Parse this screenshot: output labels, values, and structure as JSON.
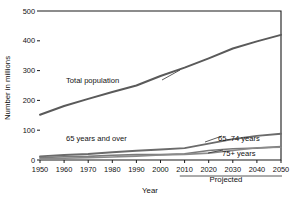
{
  "chart_data": {
    "type": "line",
    "title": "",
    "xlabel": "Year",
    "ylabel": "Number in millions",
    "x": [
      1950,
      1960,
      1970,
      1980,
      1990,
      2000,
      2010,
      2020,
      2030,
      2040,
      2050
    ],
    "xlim": [
      1950,
      2050
    ],
    "ylim": [
      0,
      500
    ],
    "yticks": [
      0,
      100,
      200,
      300,
      400,
      500
    ],
    "xticks": [
      "1950",
      "1960",
      "1970",
      "1980",
      "1990",
      "2000",
      "2010",
      "2020",
      "2030",
      "2040",
      "2050"
    ],
    "grid": false,
    "legend": "inline-annotations",
    "series": [
      {
        "name": "Total population",
        "color": "#5a5a5a",
        "values": [
          152,
          181,
          205,
          228,
          250,
          282,
          310,
          341,
          374,
          398,
          420
        ]
      },
      {
        "name": "65 years and over",
        "color": "#6b6b6b",
        "values": [
          12,
          17,
          20,
          26,
          31,
          35,
          40,
          55,
          70,
          81,
          88
        ]
      },
      {
        "name": "65–74 years",
        "color": "#7a7a7a",
        "values": [
          8,
          11,
          12,
          16,
          18,
          18,
          21,
          32,
          38,
          40,
          45
        ]
      },
      {
        "name": "75+ years",
        "color": "#8a8a8a",
        "values": [
          4,
          6,
          8,
          10,
          13,
          17,
          19,
          23,
          32,
          41,
          43
        ]
      }
    ],
    "annotations": [
      {
        "text": "Total population",
        "x": 1972,
        "y": 250
      },
      {
        "text": "65 years and over",
        "x": 1983,
        "y": 52
      },
      {
        "text": "65–74 years",
        "x": 2033,
        "y": 47
      },
      {
        "text": "75+ years",
        "x": 2036,
        "y": 18
      },
      {
        "text": "Projected",
        "x": 2031,
        "y": -90
      }
    ],
    "projection_marker": {
      "label": "Projected",
      "start_year": 2008,
      "end_year": 2050
    }
  }
}
